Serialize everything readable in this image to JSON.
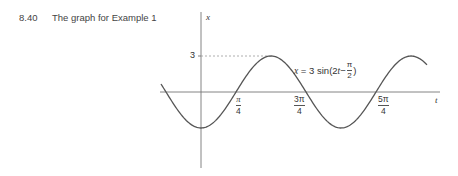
{
  "caption": {
    "number": "8.40",
    "text": "The graph for Example 1"
  },
  "axes": {
    "x_label": "t",
    "y_label": "x",
    "y_tick_label": "3"
  },
  "equation": {
    "lhs": "x",
    "equals": "=",
    "coef": "3 sin(2",
    "var": "t",
    "minus": " − ",
    "frac_num": "π",
    "frac_den": "2",
    "close": ")"
  },
  "ticks": [
    {
      "num": "π",
      "den": "4"
    },
    {
      "num": "3π",
      "den": "4"
    },
    {
      "num": "5π",
      "den": "4"
    }
  ],
  "chart_data": {
    "type": "line",
    "title": "The graph for Example 1",
    "function": "x = 3 sin(2t − π/2)",
    "xlabel": "t",
    "ylabel": "x",
    "x_tick_labels": [
      "π/4",
      "3π/4",
      "5π/4"
    ],
    "y_tick_labels": [
      "3"
    ],
    "amplitude": 3,
    "period": "π",
    "x_range": [
      "-π/4",
      "7π/4 (approx)"
    ],
    "ylim": [
      -3,
      3
    ],
    "points": [
      {
        "t": "0",
        "x": -3
      },
      {
        "t": "π/4",
        "x": 0
      },
      {
        "t": "π/2",
        "x": 3
      },
      {
        "t": "3π/4",
        "x": 0
      },
      {
        "t": "π",
        "x": -3
      },
      {
        "t": "5π/4",
        "x": 0
      },
      {
        "t": "3π/2",
        "x": 3
      }
    ],
    "annotations": [
      "dashed line from x-axis value 3 to first maximum"
    ],
    "grid": false
  }
}
